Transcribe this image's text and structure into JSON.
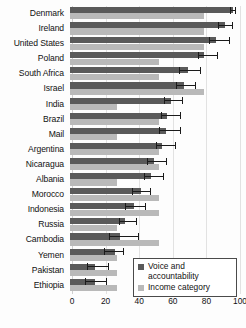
{
  "chart_data": {
    "type": "bar",
    "orientation": "horizontal",
    "title": "",
    "xlabel": "",
    "ylabel": "",
    "xlim": [
      0,
      100
    ],
    "xticks": [
      0,
      20,
      40,
      60,
      80,
      100
    ],
    "grid": true,
    "legend_position": "bottom-right",
    "categories": [
      "Denmark",
      "Ireland",
      "United States",
      "Poland",
      "South Africa",
      "Israel",
      "India",
      "Brazil",
      "Mail",
      "Argentina",
      "Nicaragua",
      "Albania",
      "Morocco",
      "Indonesia",
      "Russia",
      "Cambodia",
      "Yemen",
      "Pakistan",
      "Ethiopia"
    ],
    "series": [
      {
        "name": "Voice and accountability",
        "color": "#5a5a5a",
        "values": [
          97,
          92,
          87,
          80,
          70,
          68,
          60,
          58,
          57,
          55,
          50,
          48,
          42,
          38,
          33,
          30,
          27,
          15,
          15
        ],
        "error_low": [
          95,
          88,
          83,
          76,
          65,
          63,
          56,
          54,
          53,
          51,
          46,
          44,
          37,
          33,
          29,
          23,
          20,
          10,
          9
        ],
        "error_high": [
          99,
          97,
          95,
          88,
          78,
          75,
          67,
          66,
          66,
          63,
          58,
          56,
          48,
          45,
          40,
          41,
          32,
          23,
          22
        ]
      },
      {
        "name": "Income category",
        "color": "#b9b9b9",
        "values": [
          80,
          80,
          80,
          53,
          53,
          80,
          28,
          53,
          28,
          53,
          53,
          28,
          53,
          53,
          28,
          53,
          28,
          28,
          28
        ]
      }
    ]
  },
  "legend": {
    "items": [
      {
        "label": "Voice and accountability",
        "color": "#5a5a5a",
        "swatch_name": "legend-swatch-voice"
      },
      {
        "label": "Income category",
        "color": "#b9b9b9",
        "swatch_name": "legend-swatch-income"
      }
    ]
  },
  "axis": {
    "tick_labels": [
      "0",
      "20",
      "40",
      "60",
      "80",
      "100"
    ]
  }
}
